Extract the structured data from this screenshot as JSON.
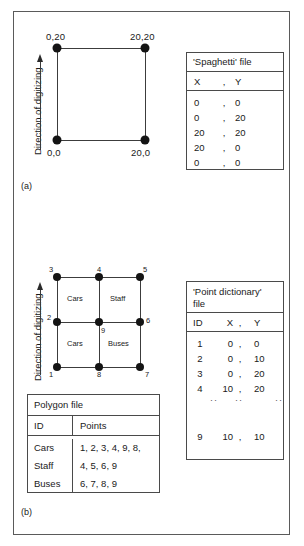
{
  "figure": {
    "panel_a": {
      "label": "(a)",
      "axis_label": "Direction of digitizing",
      "vertex_labels": [
        "0,20",
        "20,20",
        "0,0",
        "20,0"
      ],
      "table": {
        "title": "'Spaghetti' file",
        "headers": [
          "X",
          ",",
          "Y"
        ],
        "rows": [
          [
            "0",
            ",",
            "0"
          ],
          [
            "0",
            ",",
            "20"
          ],
          [
            "20",
            ",",
            "20"
          ],
          [
            "20",
            ",",
            "0"
          ],
          [
            "0",
            ",",
            "0"
          ]
        ]
      }
    },
    "panel_b": {
      "label": "(b)",
      "axis_label": "Direction of digitizing",
      "node_labels": [
        "1",
        "2",
        "3",
        "4",
        "5",
        "6",
        "7",
        "8",
        "9"
      ],
      "cell_labels": [
        "Cars",
        "Staff",
        "Cars",
        "Buses"
      ],
      "point_table": {
        "title_line1": "'Point dictionary'",
        "title_line2": "file",
        "headers": [
          "ID",
          "X",
          ",",
          "Y"
        ],
        "rows": [
          [
            "1",
            "0",
            ",",
            "0"
          ],
          [
            "2",
            "0",
            ",",
            "10"
          ],
          [
            "3",
            "0",
            ",",
            "20"
          ],
          [
            "4",
            "10",
            ",",
            "20"
          ]
        ],
        "ellipsis": ":",
        "last_row": [
          "9",
          "10",
          ",",
          "10"
        ]
      },
      "polygon_table": {
        "title": "Polygon file",
        "headers": [
          "ID",
          "Points"
        ],
        "rows": [
          [
            "Cars",
            "1, 2, 3, 4, 9, 8,"
          ],
          [
            "Staff",
            "4, 5, 6, 9"
          ],
          [
            "Buses",
            "6, 7, 8, 9"
          ]
        ]
      }
    }
  }
}
